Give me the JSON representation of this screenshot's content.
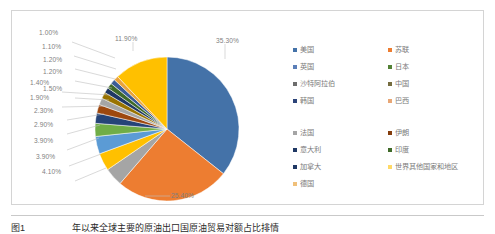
{
  "chart_data": {
    "type": "pie",
    "title": "",
    "subtitle": "",
    "xlabel": "",
    "ylabel": "",
    "legend_position": "right",
    "grid": false,
    "start_angle_deg": 0,
    "direction": "clockwise",
    "categories": [
      "美国",
      "苏联",
      "英国",
      "日本",
      "沙特阿拉伯",
      "中国",
      "韩国",
      "巴西",
      "法国",
      "伊朗",
      "意大利",
      "印度",
      "加拿大",
      "世界其他国家和地区",
      "德国"
    ],
    "values": [
      35.3,
      25.4,
      4.1,
      3.9,
      3.9,
      2.9,
      2.3,
      1.9,
      1.5,
      1.4,
      1.2,
      1.2,
      1.1,
      11.9,
      1.0
    ],
    "slice_order_clockwise": [
      {
        "label": "美国",
        "value": 35.3,
        "display": "35.30%",
        "color": "#4472a8"
      },
      {
        "label": "苏联",
        "value": 25.4,
        "display": "25.40%",
        "color": "#ed7d31"
      },
      {
        "label": "英国",
        "value": 4.1,
        "display": "4.10%",
        "color": "#a5a5a5"
      },
      {
        "label": "日本",
        "value": 3.9,
        "display": "3.90%",
        "color": "#ffc000"
      },
      {
        "label": "沙特阿拉伯",
        "value": 3.9,
        "display": "3.90%",
        "color": "#5b9bd5"
      },
      {
        "label": "中国",
        "value": 2.9,
        "display": "2.90%",
        "color": "#70ad47"
      },
      {
        "label": "韩国",
        "value": 2.3,
        "display": "2.30%",
        "color": "#264478"
      },
      {
        "label": "巴西",
        "value": 1.9,
        "display": "1.90%",
        "color": "#9e480e"
      },
      {
        "label": "法国",
        "value": 1.5,
        "display": "1.50%",
        "color": "#a5a5a5"
      },
      {
        "label": "伊朗",
        "value": 1.4,
        "display": "1.40%",
        "color": "#997300"
      },
      {
        "label": "意大利",
        "value": 1.2,
        "display": "1.20%",
        "color": "#1f3864"
      },
      {
        "label": "印度",
        "value": 1.2,
        "display": "1.20%",
        "color": "#3f6a29"
      },
      {
        "label": "加拿大",
        "value": 1.1,
        "display": "1.10%",
        "color": "#3b5c96"
      },
      {
        "label": "德国",
        "value": 1.0,
        "display": "1.00%",
        "color": "#e8a33d"
      },
      {
        "label": "世界其他国家和地区",
        "value": 11.9,
        "display": "11.90%",
        "color": "#ffc000"
      }
    ],
    "data_labels": [
      "35.30%",
      "25.40%",
      "4.10%",
      "3.90%",
      "3.90%",
      "2.90%",
      "2.30%",
      "1.90%",
      "1.50%",
      "1.40%",
      "1.20%",
      "1.20%",
      "1.10%",
      "1.00%",
      "11.90%"
    ]
  },
  "legend": {
    "groups": [
      {
        "items": [
          {
            "label": "美国",
            "color": "#4472a8"
          },
          {
            "label": "苏联",
            "color": "#ed7d31"
          },
          {
            "label": "英国",
            "color": "#5b7fb8"
          },
          {
            "label": "日本",
            "color": "#538135"
          },
          {
            "label": "沙特阿拉伯",
            "color": "#6d6d6d"
          },
          {
            "label": "中国",
            "color": "#756c3f"
          },
          {
            "label": "韩国",
            "color": "#2c4479"
          },
          {
            "label": "巴西",
            "color": "#e8a776"
          }
        ]
      },
      {
        "items": [
          {
            "label": "法国",
            "color": "#a5a5a5"
          },
          {
            "label": "伊朗",
            "color": "#843c0c"
          },
          {
            "label": "意大利",
            "color": "#1f3864"
          },
          {
            "label": "印度",
            "color": "#3f6a29"
          },
          {
            "label": "加拿大",
            "color": "#1f3864"
          },
          {
            "label": "世界其他国家和地区",
            "color": "#ffd966"
          },
          {
            "label": "德国",
            "color": "#f0c07a"
          }
        ]
      }
    ]
  },
  "caption": {
    "number": "图1",
    "text": "年以来全球主要的原油出口国原油贸易对额占比排情"
  }
}
